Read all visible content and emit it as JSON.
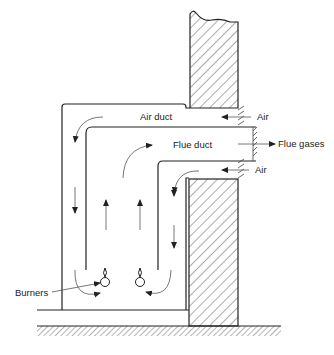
{
  "diagram": {
    "type": "technical-cross-section",
    "labels": {
      "air_duct": "Air duct",
      "flue_duct": "Flue duct",
      "air_top": "Air",
      "air_bottom": "Air",
      "flue_gases": "Flue gases",
      "burners": "Burners"
    },
    "colors": {
      "line": "#222222",
      "hatch": "#444444",
      "background": "#ffffff"
    }
  }
}
